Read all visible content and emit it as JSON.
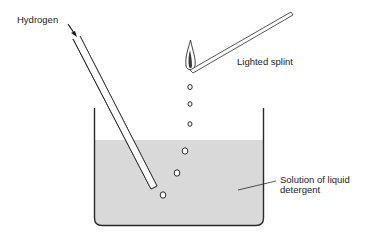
{
  "diagram": {
    "labels": {
      "hydrogen": "Hydrogen",
      "splint": "Lighted splint",
      "solution_line1": "Solution of liquid",
      "solution_line2": "detergent"
    },
    "colors": {
      "line": "#2a2a2a",
      "liquid": "#d9d9d9",
      "background": "#ffffff"
    },
    "components": [
      "delivery-tube",
      "beaker",
      "liquid-detergent-solution",
      "bubbles",
      "flame",
      "splint"
    ],
    "bubble_count": 6
  }
}
